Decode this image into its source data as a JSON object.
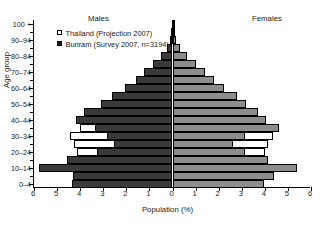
{
  "chart_data": {
    "type": "bar",
    "subtype": "population-pyramid",
    "title": "",
    "xlabel": "Population (%)",
    "ylabel": "Age group",
    "xlim": [
      -6,
      6
    ],
    "xticks": [
      "6",
      "5",
      "4",
      "3",
      "2",
      "1",
      "0",
      "1",
      "2",
      "3",
      "4",
      "5",
      "6"
    ],
    "xtick_values": [
      -6,
      -5,
      -4,
      -3,
      -2,
      -1,
      0,
      1,
      2,
      3,
      4,
      5,
      6
    ],
    "grid": false,
    "legend_position": "top-left",
    "panels": {
      "left": "Males",
      "right": "Females"
    },
    "categories": [
      "0-4",
      "5-9",
      "10-14",
      "15-19",
      "20-24",
      "25-29",
      "30-34",
      "35-39",
      "40-44",
      "45-49",
      "50-54",
      "55-59",
      "60-64",
      "65-69",
      "70-74",
      "75-79",
      "80-84",
      "85-89",
      "90-94",
      "95-99",
      "100 +"
    ],
    "ytick_labels": [
      "0-4",
      "10-14",
      "20-24",
      "30-34",
      "40-44",
      "50-54",
      "60-64",
      "70-74",
      "80-84",
      "90-94",
      "100 +"
    ],
    "series": [
      {
        "name": "Thailand (Projection 2007)",
        "swatch": "open",
        "color": "#ffffff",
        "males": [
          3.55,
          4.05,
          4.1,
          4.05,
          4.15,
          4.25,
          4.45,
          4.0,
          3.6,
          3.05,
          2.55,
          2.0,
          1.55,
          1.2,
          0.9,
          0.6,
          0.35,
          0.18,
          0.08,
          0.03,
          0.01
        ],
        "females": [
          3.35,
          3.85,
          3.9,
          3.9,
          4.0,
          4.15,
          4.35,
          3.95,
          3.6,
          3.1,
          2.65,
          2.15,
          1.7,
          1.35,
          1.05,
          0.75,
          0.48,
          0.26,
          0.12,
          0.05,
          0.02
        ]
      },
      {
        "name": "Buriram (Survey 2007, n=3194)",
        "swatch": "filled",
        "color_males": "#3a3a3a",
        "color_females": "#8d8d8d",
        "males": [
          4.35,
          4.3,
          5.8,
          4.55,
          3.25,
          2.55,
          2.85,
          3.35,
          4.2,
          3.85,
          3.1,
          2.6,
          2.05,
          1.6,
          1.25,
          0.85,
          0.5,
          0.25,
          0.12,
          0.05,
          0.02
        ],
        "females": [
          3.95,
          4.4,
          5.4,
          4.15,
          3.15,
          2.6,
          3.15,
          4.6,
          4.05,
          3.7,
          3.2,
          2.8,
          2.25,
          1.8,
          1.4,
          1.0,
          0.62,
          0.32,
          0.15,
          0.06,
          0.02
        ]
      }
    ]
  },
  "legend": {
    "items": [
      {
        "label": "Thailand (Projection 2007)",
        "swatch": "open"
      },
      {
        "label": "Buriram (Survey 2007, n=3194)",
        "swatch": "filled"
      }
    ]
  },
  "axes": {
    "x_title": "Population (%)",
    "y_title": "Age group"
  },
  "panels": {
    "males": "Males",
    "females": "Females"
  }
}
